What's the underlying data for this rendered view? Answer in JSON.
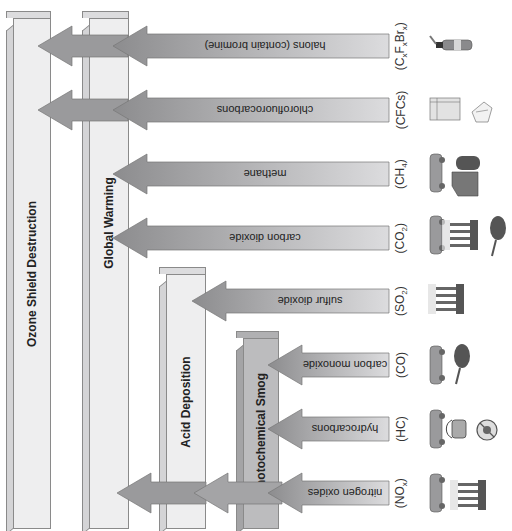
{
  "columns": [
    {
      "id": "ozone",
      "label": "Ozone Shield Destruction"
    },
    {
      "id": "warming",
      "label": "Global Warming"
    },
    {
      "id": "acid",
      "label": "Acid Deposition"
    },
    {
      "id": "smog",
      "label": "Photochemical Smog"
    }
  ],
  "pollutants": [
    {
      "name": "halons (contain bromine)",
      "formula": "(CxFxBrx)",
      "icons": [
        "fire-extinguisher"
      ]
    },
    {
      "name": "chlorofluorocarbons",
      "formula": "(CFCs)",
      "icons": [
        "refrigerator",
        "foam-container"
      ]
    },
    {
      "name": "methane",
      "formula": "(CH4)",
      "icons": [
        "car",
        "landfill"
      ]
    },
    {
      "name": "carbon dioxide",
      "formula": "(CO2)",
      "icons": [
        "car",
        "power-plant",
        "tree-cutting"
      ]
    },
    {
      "name": "sulfur dioxide",
      "formula": "(SO2)",
      "icons": [
        "power-plant"
      ]
    },
    {
      "name": "carbon monoxide",
      "formula": "(CO)",
      "icons": [
        "car",
        "tree-cutting"
      ]
    },
    {
      "name": "hydrocarbons",
      "formula": "(HC)",
      "icons": [
        "car",
        "paint-bucket",
        "no-pesticide"
      ]
    },
    {
      "name": "nitrogen oxides",
      "formula": "(NOx)",
      "icons": [
        "car",
        "power-plant"
      ]
    }
  ],
  "colors": {
    "arrow_dark": "#8c8c8e",
    "arrow_light": "#d6d6d8",
    "column": "#eeeeef",
    "smog_column": "#bcbcbe"
  }
}
